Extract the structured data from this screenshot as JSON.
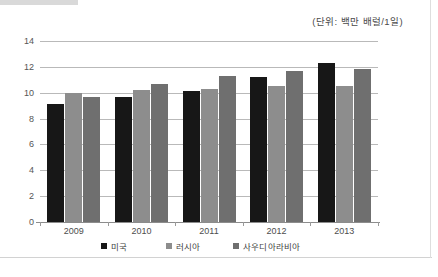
{
  "unit_note": "(단위: 백만 배럴/1일)",
  "chart_data": {
    "type": "bar",
    "title": "",
    "subtitle": "",
    "xlabel": "",
    "ylabel": "",
    "unit_note": "(단위: 백만 배럴/1일)",
    "categories": [
      "2009",
      "2010",
      "2011",
      "2012",
      "2013"
    ],
    "series": [
      {
        "name": "미국",
        "color": "#171717",
        "values": [
          9.1,
          9.7,
          10.1,
          11.2,
          12.3
        ]
      },
      {
        "name": "러시아",
        "color": "#8d8d8d",
        "values": [
          10.0,
          10.2,
          10.3,
          10.5,
          10.5
        ]
      },
      {
        "name": "사우디아라비아",
        "color": "#6f6f6f",
        "values": [
          9.7,
          10.7,
          11.3,
          11.7,
          11.8
        ]
      }
    ],
    "ylim": [
      0,
      14
    ],
    "ytick_labels": [
      "0",
      "2",
      "4",
      "6",
      "8",
      "10",
      "12",
      "14"
    ],
    "ytick_values": [
      0,
      2,
      4,
      6,
      8,
      10,
      12,
      14
    ],
    "grid": true,
    "legend_position": "bottom"
  }
}
